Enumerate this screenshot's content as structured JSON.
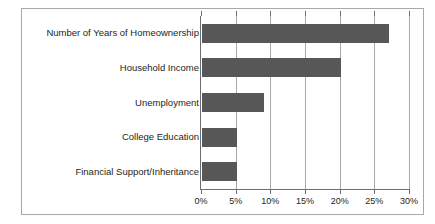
{
  "chart_data": {
    "type": "bar",
    "orientation": "horizontal",
    "title": "",
    "subtitle": "",
    "xlabel": "",
    "ylabel": "",
    "categories": [
      "Number of Years of Homeownership",
      "Household Income",
      "Unemployment",
      "College Education",
      "Financial Support/Inheritance"
    ],
    "values": [
      27,
      20,
      9,
      5,
      5
    ],
    "value_unit": "%",
    "xlim": [
      0,
      30
    ],
    "xtick_values": [
      0,
      5,
      10,
      15,
      20,
      25,
      30
    ],
    "xtick_labels": [
      "0%",
      "5%",
      "10%",
      "15%",
      "20%",
      "25%",
      "30%"
    ],
    "grid": "vertical",
    "legend": "none",
    "bar_color": "#575757",
    "axis_color": "#6d6e71",
    "gridline_color": "#a7a9ac",
    "frame_color": "#a7a9ac",
    "background_color": "#ffffff",
    "text_color": "#231f20"
  }
}
